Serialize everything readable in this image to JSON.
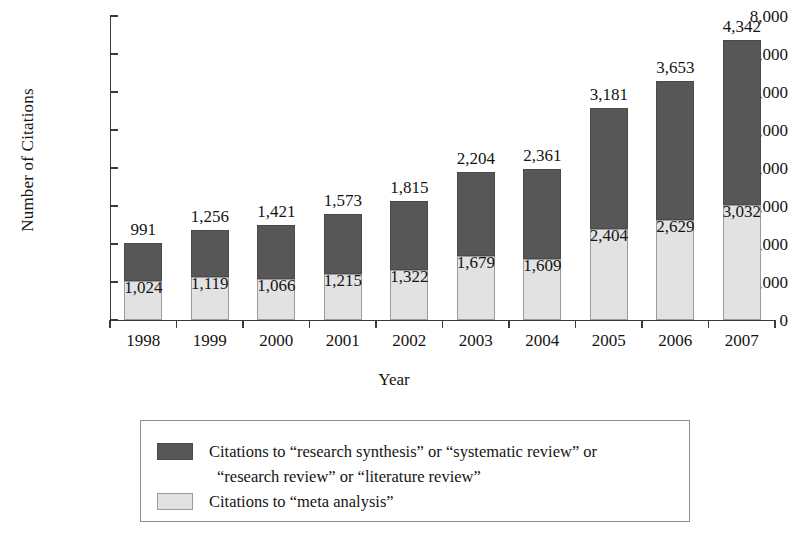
{
  "chart_data": {
    "type": "bar",
    "subtype": "stacked-bar",
    "title": "",
    "xlabel": "Year",
    "ylabel": "Number of Citations",
    "categories": [
      "1998",
      "1999",
      "2000",
      "2001",
      "2002",
      "2003",
      "2004",
      "2005",
      "2006",
      "2007"
    ],
    "ylim": [
      0,
      8000
    ],
    "ytick_values": [
      0,
      1000,
      2000,
      3000,
      4000,
      5000,
      6000,
      7000,
      8000
    ],
    "ytick_labels": [
      "0",
      "1,000",
      "2,000",
      "3,000",
      "4,000",
      "5,000",
      "6,000",
      "7,000",
      "8,000"
    ],
    "grid": false,
    "legend_position": "below-plot",
    "series": [
      {
        "name": "Citations to “meta analysis”",
        "color": "#e2e2e2",
        "stack_order": "bottom",
        "values": [
          1024,
          1119,
          1066,
          1215,
          1322,
          1679,
          1609,
          2404,
          2629,
          3032
        ],
        "labels": [
          "1,024",
          "1,119",
          "1,066",
          "1,215",
          "1,322",
          "1,679",
          "1,609",
          "2,404",
          "2,629",
          "3,032"
        ]
      },
      {
        "name": "Citations to “research synthesis” or “systematic review” or “research review” or “literature review”",
        "color": "#575757",
        "stack_order": "top",
        "values": [
          991,
          1256,
          1421,
          1573,
          1815,
          2204,
          2361,
          3181,
          3653,
          4342
        ],
        "labels": [
          "991",
          "1,256",
          "1,421",
          "1,573",
          "1,815",
          "2,204",
          "2,361",
          "3,181",
          "3,653",
          "4,342"
        ]
      }
    ],
    "totals": [
      2015,
      2375,
      2487,
      2788,
      3137,
      3883,
      3970,
      5585,
      6282,
      7374
    ]
  },
  "legend": {
    "entries": [
      {
        "swatch": "dark",
        "line1": "Citations to “research synthesis” or “systematic review” or",
        "line2": "“research review” or “literature review”"
      },
      {
        "swatch": "light",
        "line1": "Citations to “meta analysis”",
        "line2": ""
      }
    ]
  },
  "colors": {
    "dark_segment": "#575757",
    "light_segment": "#e2e2e2",
    "axis": "#3b3b3b",
    "legend_border": "#8f8f8f",
    "background": "#ffffff"
  }
}
